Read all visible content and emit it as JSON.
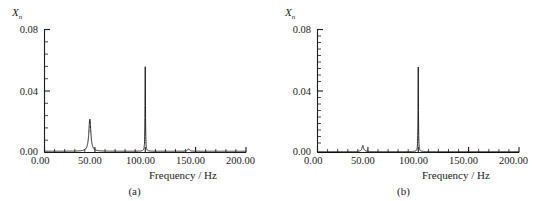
{
  "figure": {
    "panels": [
      {
        "id": "a",
        "caption": "(a)",
        "ylabel_main": "X",
        "ylabel_sub": "n",
        "xlabel": "Frequency / Hz",
        "xticks": [
          "0.00",
          "50.00",
          "100.00",
          "150.00",
          "200.00"
        ],
        "yticks": [
          "0.00",
          "0.04",
          "0.08"
        ]
      },
      {
        "id": "b",
        "caption": "(b)",
        "ylabel_main": "X",
        "ylabel_sub": "n",
        "xlabel": "Frequency / Hz",
        "xticks": [
          "0.00",
          "50.00",
          "100.00",
          "150.00",
          "200.00"
        ],
        "yticks": [
          "0.00",
          "0.04",
          "0.08"
        ]
      }
    ]
  },
  "chart_data": [
    {
      "type": "line",
      "title": "(a)",
      "xlabel": "Frequency / Hz",
      "ylabel": "X_n",
      "xlim": [
        0,
        200
      ],
      "ylim": [
        0,
        0.08
      ],
      "xticks": [
        0,
        50,
        100,
        150,
        200
      ],
      "yticks": [
        0,
        0.04,
        0.08
      ],
      "xtick_labels": [
        "0.00",
        "50.00",
        "100.00",
        "150.00",
        "200.00"
      ],
      "ytick_labels": [
        "0.00",
        "0.04",
        "0.08"
      ],
      "grid": false,
      "legend": null,
      "peaks": [
        {
          "frequency": 45,
          "amplitude": 0.021,
          "width": 2.4,
          "note": "broad resonance peak"
        },
        {
          "frequency": 100,
          "amplitude": 0.055,
          "width": 0.5,
          "note": "sharp excitation spike"
        },
        {
          "frequency": 143,
          "amplitude": 0.0016,
          "width": 2.0,
          "note": "very small bump"
        }
      ],
      "baseline": 0.0008,
      "x": [
        0,
        5,
        10,
        15,
        20,
        25,
        30,
        35,
        38,
        40,
        42,
        43,
        44,
        45,
        46,
        47,
        48,
        50,
        52,
        55,
        60,
        65,
        70,
        75,
        80,
        85,
        90,
        95,
        97,
        98,
        99,
        99.5,
        100,
        100.5,
        101,
        102,
        103,
        105,
        110,
        115,
        120,
        125,
        130,
        135,
        140,
        143,
        146,
        150,
        155,
        160,
        165,
        170,
        175,
        180,
        185,
        190,
        195,
        200
      ],
      "values": [
        0.0009,
        0.0009,
        0.001,
        0.001,
        0.0011,
        0.0012,
        0.0014,
        0.0019,
        0.0026,
        0.0036,
        0.0068,
        0.0105,
        0.0163,
        0.0211,
        0.0162,
        0.0104,
        0.0068,
        0.0035,
        0.0024,
        0.0017,
        0.0012,
        0.001,
        0.0009,
        0.0009,
        0.0009,
        0.0009,
        0.001,
        0.0012,
        0.0016,
        0.0028,
        0.0098,
        0.0262,
        0.0553,
        0.0261,
        0.0097,
        0.0029,
        0.0016,
        0.001,
        0.0008,
        0.0008,
        0.0008,
        0.0008,
        0.0008,
        0.0009,
        0.0012,
        0.0016,
        0.0012,
        0.0008,
        0.0008,
        0.0007,
        0.0007,
        0.0007,
        0.0007,
        0.0007,
        0.0007,
        0.0007,
        0.0007,
        0.0007
      ]
    },
    {
      "type": "line",
      "title": "(b)",
      "xlabel": "Frequency / Hz",
      "ylabel": "X_n",
      "xlim": [
        0,
        200
      ],
      "ylim": [
        0,
        0.08
      ],
      "xticks": [
        0,
        50,
        100,
        150,
        200
      ],
      "yticks": [
        0,
        0.04,
        0.08
      ],
      "xtick_labels": [
        "0.00",
        "50.00",
        "100.00",
        "150.00",
        "200.00"
      ],
      "ytick_labels": [
        "0.00",
        "0.04",
        "0.08"
      ],
      "grid": false,
      "legend": null,
      "peaks": [
        {
          "frequency": 45,
          "amplitude": 0.004,
          "width": 2.0,
          "note": "strongly attenuated resonance peak"
        },
        {
          "frequency": 100,
          "amplitude": 0.055,
          "width": 0.45,
          "note": "sharp excitation spike"
        }
      ],
      "baseline": 0.0006,
      "x": [
        0,
        5,
        10,
        15,
        20,
        25,
        30,
        35,
        38,
        40,
        42,
        43,
        44,
        45,
        46,
        47,
        48,
        50,
        52,
        55,
        60,
        65,
        70,
        75,
        80,
        85,
        90,
        95,
        97,
        98,
        99,
        99.5,
        100,
        100.5,
        101,
        102,
        103,
        105,
        110,
        115,
        120,
        125,
        130,
        135,
        140,
        145,
        150,
        155,
        160,
        165,
        170,
        175,
        180,
        185,
        190,
        195,
        200
      ],
      "values": [
        0.0007,
        0.0007,
        0.0007,
        0.0007,
        0.0008,
        0.0008,
        0.0009,
        0.0011,
        0.0014,
        0.0017,
        0.0025,
        0.0029,
        0.0035,
        0.004,
        0.0034,
        0.0028,
        0.0022,
        0.0014,
        0.0011,
        0.0009,
        0.0007,
        0.0007,
        0.0006,
        0.0006,
        0.0006,
        0.0006,
        0.0007,
        0.0009,
        0.0013,
        0.0024,
        0.0092,
        0.0258,
        0.0551,
        0.0257,
        0.0091,
        0.0025,
        0.0013,
        0.0008,
        0.0006,
        0.0006,
        0.0006,
        0.0006,
        0.0006,
        0.0006,
        0.0006,
        0.0006,
        0.0006,
        0.0006,
        0.0006,
        0.0006,
        0.0006,
        0.0006,
        0.0006,
        0.0006,
        0.0006,
        0.0006,
        0.0006
      ]
    }
  ],
  "colors": {
    "ink": "#1b1b1b",
    "curve": "#222222",
    "background": "#ffffff"
  }
}
